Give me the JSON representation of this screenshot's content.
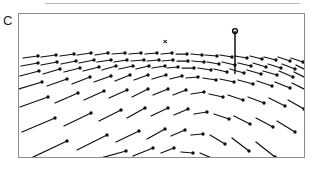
{
  "figure": {
    "panel_label": "C",
    "top_rule_visible": true,
    "frame": {
      "x": 18,
      "y": 13,
      "width": 287,
      "height": 145,
      "border_color": "#8d8d8d"
    },
    "background_color": "#ffffff",
    "ink_color": "#111111"
  },
  "markers": {
    "fixation_cross": {
      "glyph": "×",
      "x": 146,
      "y": 28,
      "name": "fixation-cross-marker"
    },
    "pole": {
      "name": "vertical-pole-marker",
      "x": 216,
      "top_y": 17,
      "bottom_y": 60,
      "head_radius": 2.4,
      "stroke_width": 1.4
    }
  },
  "chart_data": {
    "type": "scatter",
    "title": "C",
    "xlabel": "",
    "ylabel": "",
    "xlim": [
      0,
      287
    ],
    "ylim": [
      0,
      145
    ],
    "grid": false,
    "legend": null,
    "axis_ticks": false,
    "focus_of_expansion": [
      146,
      28
    ],
    "glyph_style": {
      "head": "filled-circle",
      "head_radius": 1.7,
      "line_width": 1.25
    },
    "vectors": [
      [
        4,
        44,
        19,
        42
      ],
      [
        22,
        43,
        37,
        41
      ],
      [
        41,
        42,
        55,
        40
      ],
      [
        58,
        41,
        72,
        39
      ],
      [
        76,
        41,
        89,
        39
      ],
      [
        93,
        40,
        106,
        39
      ],
      [
        110,
        40,
        122,
        39
      ],
      [
        126,
        40,
        138,
        39
      ],
      [
        142,
        40,
        153,
        39
      ],
      [
        157,
        40,
        168,
        40
      ],
      [
        172,
        40,
        183,
        41
      ],
      [
        186,
        41,
        198,
        42
      ],
      [
        201,
        41,
        213,
        43
      ],
      [
        216,
        42,
        228,
        44
      ],
      [
        231,
        42,
        243,
        45
      ],
      [
        245,
        43,
        257,
        46
      ],
      [
        259,
        43,
        271,
        47
      ],
      [
        272,
        44,
        284,
        48
      ],
      [
        2,
        52,
        19,
        49
      ],
      [
        22,
        51,
        38,
        48
      ],
      [
        42,
        50,
        57,
        47
      ],
      [
        60,
        49,
        75,
        46
      ],
      [
        78,
        48,
        92,
        46
      ],
      [
        95,
        48,
        108,
        46
      ],
      [
        112,
        47,
        125,
        46
      ],
      [
        128,
        47,
        140,
        46
      ],
      [
        143,
        47,
        154,
        46
      ],
      [
        158,
        47,
        169,
        47
      ],
      [
        173,
        47,
        185,
        48
      ],
      [
        188,
        48,
        200,
        50
      ],
      [
        203,
        48,
        216,
        51
      ],
      [
        219,
        49,
        232,
        52
      ],
      [
        234,
        49,
        247,
        53
      ],
      [
        249,
        50,
        262,
        54
      ],
      [
        263,
        50,
        276,
        55
      ],
      [
        277,
        51,
        287,
        56
      ],
      [
        1,
        62,
        20,
        57
      ],
      [
        24,
        60,
        41,
        55
      ],
      [
        45,
        58,
        61,
        54
      ],
      [
        64,
        57,
        80,
        53
      ],
      [
        83,
        56,
        97,
        52
      ],
      [
        100,
        55,
        114,
        52
      ],
      [
        117,
        55,
        130,
        52
      ],
      [
        133,
        54,
        146,
        52
      ],
      [
        148,
        54,
        159,
        53
      ],
      [
        163,
        54,
        175,
        54
      ],
      [
        179,
        54,
        192,
        56
      ],
      [
        195,
        55,
        208,
        58
      ],
      [
        211,
        55,
        225,
        59
      ],
      [
        228,
        56,
        242,
        60
      ],
      [
        244,
        57,
        258,
        61
      ],
      [
        260,
        57,
        274,
        63
      ],
      [
        275,
        58,
        287,
        64
      ],
      [
        0,
        75,
        23,
        68
      ],
      [
        28,
        72,
        48,
        65
      ],
      [
        53,
        70,
        71,
        63
      ],
      [
        75,
        68,
        92,
        62
      ],
      [
        96,
        67,
        111,
        61
      ],
      [
        115,
        66,
        129,
        61
      ],
      [
        133,
        65,
        147,
        61
      ],
      [
        151,
        65,
        163,
        62
      ],
      [
        167,
        64,
        179,
        63
      ],
      [
        184,
        64,
        197,
        66
      ],
      [
        201,
        65,
        215,
        68
      ],
      [
        219,
        66,
        234,
        70
      ],
      [
        238,
        67,
        253,
        72
      ],
      [
        256,
        68,
        271,
        74
      ],
      [
        273,
        69,
        287,
        76
      ],
      [
        1,
        93,
        29,
        83
      ],
      [
        36,
        89,
        59,
        79
      ],
      [
        65,
        86,
        85,
        77
      ],
      [
        90,
        84,
        108,
        76
      ],
      [
        113,
        83,
        129,
        75
      ],
      [
        134,
        81,
        149,
        75
      ],
      [
        154,
        81,
        167,
        76
      ],
      [
        172,
        80,
        185,
        78
      ],
      [
        190,
        80,
        204,
        83
      ],
      [
        209,
        81,
        224,
        86
      ],
      [
        229,
        83,
        245,
        89
      ],
      [
        250,
        84,
        266,
        92
      ],
      [
        269,
        86,
        285,
        95
      ],
      [
        3,
        118,
        36,
        104
      ],
      [
        45,
        112,
        72,
        99
      ],
      [
        80,
        107,
        102,
        96
      ],
      [
        108,
        104,
        126,
        94
      ],
      [
        132,
        102,
        149,
        94
      ],
      [
        155,
        101,
        169,
        95
      ],
      [
        175,
        100,
        188,
        98
      ],
      [
        195,
        100,
        210,
        105
      ],
      [
        215,
        102,
        231,
        110
      ],
      [
        237,
        104,
        254,
        113
      ],
      [
        258,
        107,
        276,
        118
      ],
      [
        10,
        145,
        48,
        127
      ],
      [
        58,
        136,
        88,
        121
      ],
      [
        97,
        128,
        120,
        117
      ],
      [
        128,
        125,
        146,
        115
      ],
      [
        152,
        122,
        166,
        116
      ],
      [
        172,
        121,
        184,
        120
      ],
      [
        191,
        121,
        206,
        130
      ],
      [
        213,
        124,
        230,
        137
      ],
      [
        237,
        128,
        256,
        143
      ],
      [
        78,
        145,
        107,
        137
      ],
      [
        114,
        142,
        134,
        134
      ],
      [
        142,
        139,
        155,
        134
      ],
      [
        162,
        138,
        174,
        139
      ],
      [
        181,
        139,
        195,
        145
      ]
    ]
  }
}
